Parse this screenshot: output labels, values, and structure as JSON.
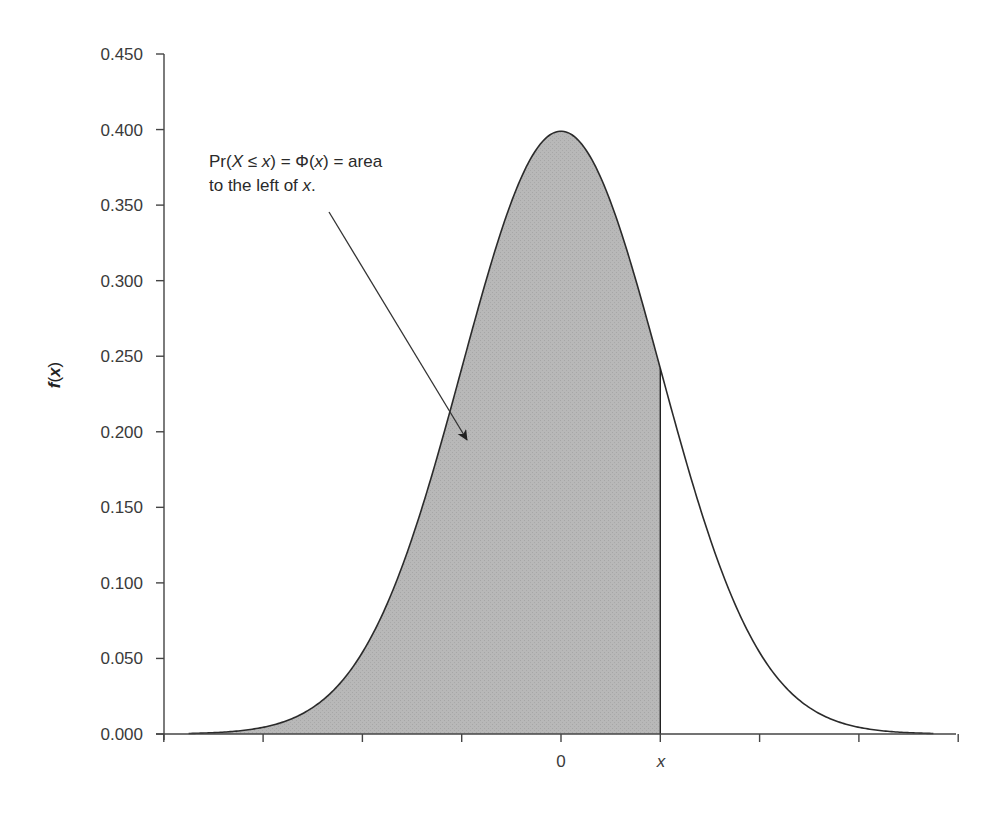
{
  "chart_data": {
    "type": "area",
    "title": "",
    "xlabel": "",
    "ylabel": "f(x)",
    "ylim": [
      0,
      0.45
    ],
    "xlim": [
      -4,
      4
    ],
    "grid": false,
    "legend": null,
    "y_ticks": [
      "0.000",
      "0.050",
      "0.100",
      "0.150",
      "0.200",
      "0.250",
      "0.300",
      "0.350",
      "0.400",
      "0.450"
    ],
    "x_ticks": [
      -4,
      -3,
      -2,
      -1,
      0,
      1,
      2,
      3,
      4
    ],
    "x_tick_labels": [
      {
        "at": 0,
        "label": "0"
      },
      {
        "at": 1,
        "label": "x"
      }
    ],
    "series": [
      {
        "name": "f(x) standard normal density",
        "function": "exp(-x^2/2)/sqrt(2*pi)",
        "x": [
          -4,
          -3.5,
          -3,
          -2.5,
          -2,
          -1.5,
          -1,
          -0.5,
          0,
          0.5,
          1,
          1.5,
          2,
          2.5,
          3,
          3.5,
          4
        ],
        "values": [
          0.0001,
          0.0009,
          0.0044,
          0.0175,
          0.054,
          0.1295,
          0.242,
          0.3521,
          0.3989,
          0.3521,
          0.242,
          0.1295,
          0.054,
          0.0175,
          0.0044,
          0.0009,
          0.0001
        ]
      }
    ],
    "shaded_region": {
      "from": -4,
      "to": 1,
      "color": "#b3b3b3"
    },
    "annotation": {
      "line1_parts": [
        "Pr(",
        "X",
        " ≤ ",
        "x",
        ") = Φ(",
        "x",
        ") = area"
      ],
      "line2_parts": [
        "to the left of ",
        "x",
        "."
      ],
      "arrow_target": "shaded area"
    },
    "colors": {
      "curve": "#2b2b2b",
      "fill": "#b3b3b3",
      "axis": "#444444"
    }
  },
  "labels": {
    "ylabel_f": "f",
    "ylabel_open": "(",
    "ylabel_x": "x",
    "ylabel_close": ")",
    "y_ticks": [
      "0.000",
      "0.050",
      "0.100",
      "0.150",
      "0.200",
      "0.250",
      "0.300",
      "0.350",
      "0.400",
      "0.450"
    ],
    "x_zero": "0",
    "x_mark": "x",
    "annot1": [
      "Pr(",
      "X",
      " ≤ ",
      "x",
      ") = Φ(",
      "x",
      ") = area"
    ],
    "annot2": [
      "to the left of ",
      "x",
      "."
    ]
  }
}
